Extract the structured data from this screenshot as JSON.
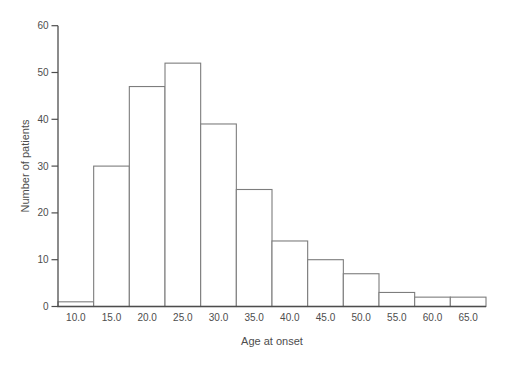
{
  "figure": {
    "background": "#ffffff",
    "axis_color": "#4d4d4d",
    "tick_color": "#4d4d4d",
    "text_color": "#4d4d4d",
    "bar_stroke": "#7d7d7d",
    "bar_fill": "#ffffff"
  },
  "chart_data": {
    "type": "bar",
    "title": "",
    "xlabel": "Age at onset",
    "ylabel": "Number of patients",
    "categories": [
      "10.0",
      "15.0",
      "20.0",
      "25.0",
      "30.0",
      "35.0",
      "40.0",
      "45.0",
      "50.0",
      "55.0",
      "60.0",
      "65.0"
    ],
    "values": [
      1,
      30,
      47,
      52,
      39,
      25,
      14,
      10,
      7,
      3,
      2,
      2
    ],
    "yticks": [
      0,
      10,
      20,
      30,
      40,
      50,
      60
    ],
    "ylim": [
      0,
      60
    ],
    "bar_gap": 0,
    "grid": false,
    "legend": "none"
  }
}
